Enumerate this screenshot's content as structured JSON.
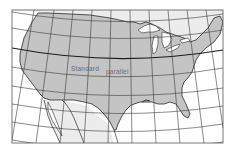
{
  "map": {
    "title": "Contiguous United States conic projection",
    "projection": "conic",
    "labels": {
      "standard_parallel_word1": "Standard",
      "standard_parallel_word2": "parallel"
    },
    "colors": {
      "usa_fill": "#c4c4c4",
      "neighbor_fill": "#ececec",
      "water_fill": "#ffffff",
      "graticule": "#3a3a3a",
      "coastline": "#2a2a2a",
      "frame": "#555555",
      "label_text": "#6a6a6a"
    },
    "regions": [
      {
        "name": "United States",
        "shade": "gray"
      },
      {
        "name": "Canada",
        "shade": "light"
      },
      {
        "name": "Mexico",
        "shade": "light"
      },
      {
        "name": "Great Lakes",
        "shade": "water"
      },
      {
        "name": "Pacific Ocean",
        "shade": "water"
      },
      {
        "name": "Gulf of Mexico",
        "shade": "water"
      },
      {
        "name": "Atlantic Ocean",
        "shade": "water"
      }
    ]
  }
}
